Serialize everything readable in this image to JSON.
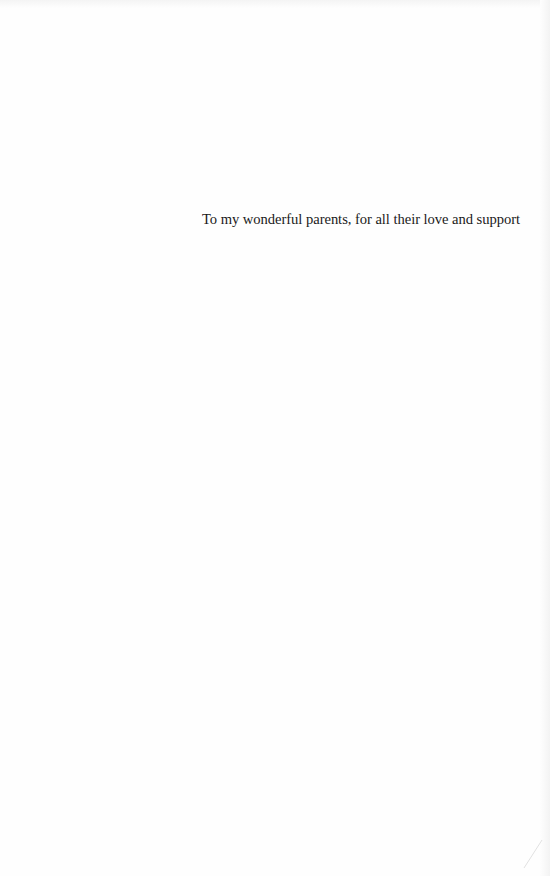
{
  "page": {
    "type": "dedication",
    "dedication_text": "To my wonderful parents, for all their love and support"
  },
  "colors": {
    "background": "#fefefe",
    "text": "#1a1a1a"
  }
}
